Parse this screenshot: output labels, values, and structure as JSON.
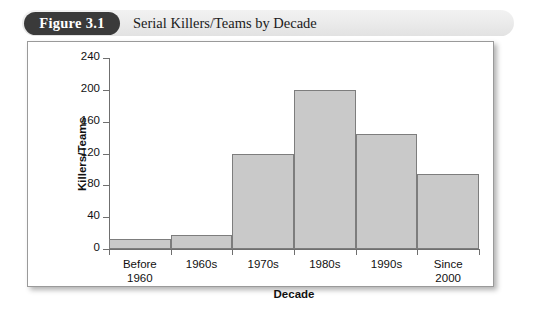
{
  "figure": {
    "badge_label": "Figure 3.1",
    "title": "Serial Killers/Teams by Decade"
  },
  "chart_data": {
    "type": "bar",
    "title": "Serial Killers/Teams by Decade",
    "xlabel": "Decade",
    "ylabel": "Killers/Teams",
    "categories": [
      "Before 1960",
      "1960s",
      "1970s",
      "1980s",
      "1990s",
      "Since 2000"
    ],
    "category_lines": [
      [
        "Before",
        "1960"
      ],
      [
        "1960s"
      ],
      [
        "1970s"
      ],
      [
        "1980s"
      ],
      [
        "1990s"
      ],
      [
        "Since",
        "2000"
      ]
    ],
    "values": [
      13,
      18,
      119,
      200,
      145,
      94
    ],
    "ylim": [
      0,
      240
    ],
    "yticks": [
      0,
      40,
      80,
      120,
      160,
      200,
      240
    ],
    "grid": false,
    "legend": "none",
    "bar_style": "contiguous",
    "bar_fill": "#c9c9c9",
    "bar_stroke": "#7d7d7d",
    "axis_color": "#6f6f6f",
    "plot_background": "#ffffff"
  }
}
